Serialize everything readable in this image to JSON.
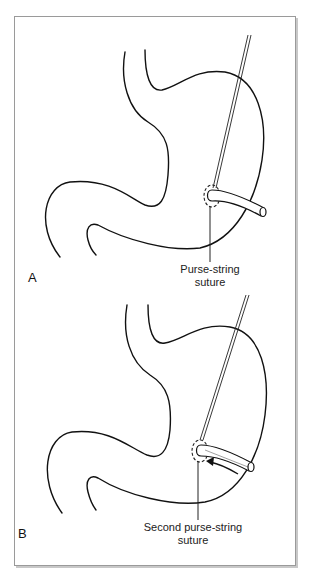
{
  "figure": {
    "panels": [
      {
        "letter": "A",
        "callout_line1": "Purse-string",
        "callout_line2": "suture"
      },
      {
        "letter": "B",
        "callout_line1": "Second purse-string",
        "callout_line2": "suture"
      }
    ],
    "colors": {
      "line": "#111111",
      "frame": "#9a9a9a",
      "background": "#ffffff"
    }
  }
}
